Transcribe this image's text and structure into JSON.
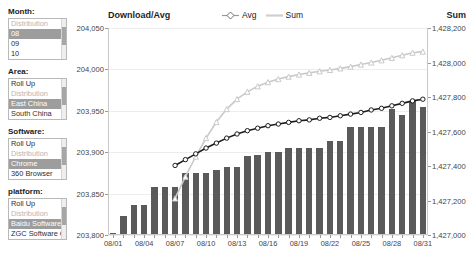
{
  "filters": [
    {
      "name": "month",
      "title": "Month:",
      "options": [
        {
          "label": "Distribution",
          "state": "dim"
        },
        {
          "label": "08",
          "state": "selected"
        },
        {
          "label": "09",
          "state": "normal"
        },
        {
          "label": "10",
          "state": "normal"
        }
      ]
    },
    {
      "name": "area",
      "title": "Area:",
      "options": [
        {
          "label": "Roll Up",
          "state": "normal"
        },
        {
          "label": "Distribution",
          "state": "dim"
        },
        {
          "label": "East China",
          "state": "selected"
        },
        {
          "label": "South China",
          "state": "normal"
        }
      ]
    },
    {
      "name": "software",
      "title": "Software:",
      "options": [
        {
          "label": "Roll Up",
          "state": "normal"
        },
        {
          "label": "Distribution",
          "state": "dim"
        },
        {
          "label": "Chrome",
          "state": "selected"
        },
        {
          "label": "360 Browser",
          "state": "normal"
        }
      ]
    },
    {
      "name": "platform",
      "title": "platform:",
      "options": [
        {
          "label": "Roll Up",
          "state": "normal"
        },
        {
          "label": "Distribution",
          "state": "dim"
        },
        {
          "label": "Baidu Software",
          "state": "selected"
        },
        {
          "label": "ZGC Software C",
          "state": "normal"
        }
      ]
    }
  ],
  "colors": {
    "bar": "#5a5a5a",
    "avg_line": "#1c1c1c",
    "sum_line": "#c9c9c9",
    "grid": "#ededed",
    "axis": "#c9c9c9",
    "selection": "#9d9d9d"
  },
  "chart_data": {
    "type": "bar",
    "title": "Download/Avg",
    "right_axis_title": "Sum",
    "xlabel": "",
    "ylabel": "Download/Avg",
    "grid": true,
    "legend_position": "top-center",
    "legend": [
      "Avg",
      "Sum"
    ],
    "categories": [
      "08/01",
      "08/02",
      "08/03",
      "08/04",
      "08/05",
      "08/06",
      "08/07",
      "08/08",
      "08/09",
      "08/10",
      "08/11",
      "08/12",
      "08/13",
      "08/14",
      "08/15",
      "08/16",
      "08/17",
      "08/18",
      "08/19",
      "08/20",
      "08/21",
      "08/22",
      "08/23",
      "08/24",
      "08/25",
      "08/26",
      "08/27",
      "08/28",
      "08/29",
      "08/30",
      "08/31"
    ],
    "xtick_labels": [
      "08/01",
      "08/04",
      "08/07",
      "08/10",
      "08/13",
      "08/16",
      "08/19",
      "08/22",
      "08/25",
      "08/28",
      "08/31"
    ],
    "ylim": [
      203800,
      204050
    ],
    "yticks": [
      "203,800",
      "203,850",
      "203,900",
      "203,950",
      "204,000",
      "204,050"
    ],
    "ytick_values": [
      203800,
      203850,
      203900,
      203950,
      204000,
      204050
    ],
    "y2lim": [
      1427000,
      1428200
    ],
    "y2ticks": [
      "1,427,000",
      "1,427,200",
      "1,427,400",
      "1,427,600",
      "1,427,800",
      "1,428,000",
      "1,428,200"
    ],
    "y2tick_values": [
      1427000,
      1427200,
      1427400,
      1427600,
      1427800,
      1428000,
      1428200
    ],
    "series": [
      {
        "name": "Download",
        "type": "bar",
        "axis": "left",
        "values": [
          203803,
          203823,
          203836,
          203836,
          203858,
          203858,
          203858,
          203875,
          203875,
          203875,
          203878,
          203882,
          203882,
          203895,
          203897,
          203900,
          203900,
          203905,
          203905,
          203905,
          203905,
          203914,
          203914,
          203930,
          203930,
          203930,
          203930,
          203952,
          203945,
          203962,
          203955
        ]
      },
      {
        "name": "Avg",
        "type": "line",
        "axis": "left",
        "marker": "circle",
        "values": [
          null,
          null,
          null,
          null,
          null,
          null,
          203884,
          203891,
          203898,
          203905,
          203911,
          203917,
          203922,
          203926,
          203929,
          203932,
          203934,
          203936,
          203938,
          203939,
          203941,
          203942,
          203944,
          203946,
          203948,
          203951,
          203953,
          203956,
          203959,
          203962,
          203964
        ]
      },
      {
        "name": "Sum",
        "type": "line",
        "axis": "right",
        "marker": "triangle",
        "values": [
          null,
          null,
          null,
          null,
          null,
          null,
          1427212,
          1427338,
          1427455,
          1427562,
          1427655,
          1427730,
          1427788,
          1427830,
          1427862,
          1427886,
          1427904,
          1427918,
          1427930,
          1427940,
          1427949,
          1427957,
          1427966,
          1427976,
          1427988,
          1428000,
          1428013,
          1428027,
          1428042,
          1428057,
          1428063
        ]
      }
    ]
  }
}
